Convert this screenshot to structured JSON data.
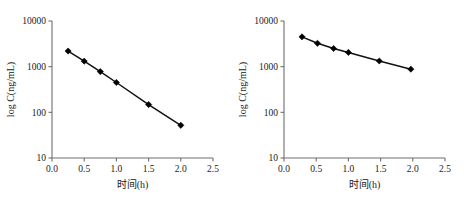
{
  "figure": {
    "panel_count": 2,
    "background_color": "#ffffff",
    "series_color": "#111111",
    "axis_color": "#6e6e6e"
  },
  "chart_data": [
    {
      "type": "line",
      "panel": "left",
      "title": "",
      "subtitle": "",
      "xlabel": "时间(h)",
      "ylabel": "log C(ng/mL)",
      "xlim": [
        0.0,
        2.5
      ],
      "ylim": [
        10,
        10000
      ],
      "yscale": "log",
      "xscale": "linear",
      "grid": false,
      "legend": "none",
      "xticks": [
        "0.0",
        "0.5",
        "1.0",
        "1.5",
        "2.0",
        "2.5"
      ],
      "xtick_values": [
        0.0,
        0.5,
        1.0,
        1.5,
        2.0,
        2.5
      ],
      "yticks": [
        "10000",
        "1000",
        "100",
        "10"
      ],
      "ytick_values": [
        10000,
        1000,
        100,
        10
      ],
      "marker": "diamond",
      "x": [
        0.25,
        0.5,
        0.75,
        1.0,
        1.5,
        2.0
      ],
      "values": [
        2200,
        1320,
        780,
        450,
        148,
        52
      ],
      "series": [
        {
          "name": "浓度-时间",
          "x": [
            0.25,
            0.5,
            0.75,
            1.0,
            1.5,
            2.0
          ],
          "values": [
            2200,
            1320,
            780,
            450,
            148,
            52
          ]
        }
      ],
      "annotations": []
    },
    {
      "type": "line",
      "panel": "right",
      "title": "",
      "subtitle": "",
      "xlabel": "时间(h)",
      "ylabel": "log C(ng/mL)",
      "xlim": [
        0.0,
        2.5
      ],
      "ylim": [
        10,
        10000
      ],
      "yscale": "log",
      "xscale": "linear",
      "grid": false,
      "legend": "none",
      "xticks": [
        "0.0",
        "0.5",
        "1.0",
        "1.5",
        "2.0",
        "2.5"
      ],
      "xtick_values": [
        0.0,
        0.5,
        1.0,
        1.5,
        2.0,
        2.5
      ],
      "yticks": [
        "10000",
        "1000",
        "100",
        "10"
      ],
      "ytick_values": [
        10000,
        1000,
        100,
        10
      ],
      "marker": "diamond",
      "x": [
        0.28,
        0.52,
        0.77,
        1.0,
        1.48,
        1.97
      ],
      "values": [
        4500,
        3250,
        2500,
        2050,
        1330,
        880
      ],
      "series": [
        {
          "name": "浓度-时间",
          "x": [
            0.28,
            0.52,
            0.77,
            1.0,
            1.48,
            1.97
          ],
          "values": [
            4500,
            3250,
            2500,
            2050,
            1330,
            880
          ]
        }
      ],
      "annotations": []
    }
  ]
}
